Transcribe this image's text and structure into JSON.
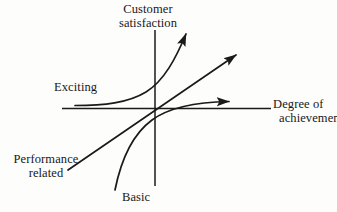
{
  "diagram": {
    "title_implied": "Kano model",
    "axes": {
      "y_axis": {
        "name": "y-axis",
        "label_line1": "Customer",
        "label_line2": "satisfaction"
      },
      "x_axis": {
        "name": "x-axis",
        "label_line1": "Degree of",
        "label_line2": "achievement"
      }
    },
    "curves": [
      {
        "id": "exciting",
        "label": "Exciting",
        "shape": "concave-upward exponential rising curve with arrowhead at top right",
        "arrow": true
      },
      {
        "id": "performance-related",
        "label_line1": "Performance",
        "label_line2": "related",
        "shape": "straight diagonal line through origin with arrowhead at upper right",
        "arrow": true
      },
      {
        "id": "basic",
        "label": "Basic",
        "shape": "concave-downward logarithmic saturating curve with arrowhead at right",
        "arrow": true
      }
    ],
    "colors": {
      "line": "#1a1a1a",
      "background": "#fdfdfc",
      "text": "#181818"
    }
  }
}
